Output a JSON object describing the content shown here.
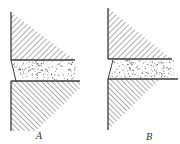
{
  "figure": {
    "panels": [
      {
        "id": "A",
        "label": "A",
        "regions": [
          "upper-solid-hatched",
          "dotted-interlayer",
          "lower-solid-hatched"
        ],
        "interlayer_edge": "slants outward toward bottom"
      },
      {
        "id": "B",
        "label": "B",
        "regions": [
          "upper-solid-hatched",
          "dotted-interlayer",
          "lower-solid-hatched"
        ],
        "interlayer_edge": "slants inward toward bottom"
      }
    ],
    "colors": {
      "line": "#3a3a3a",
      "hatch": "#4a4a4a",
      "dots": "#555555",
      "background": "#ffffff"
    }
  }
}
